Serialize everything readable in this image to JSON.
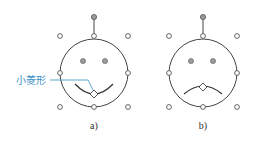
{
  "figures": [
    {
      "id": "a",
      "caption": "a)",
      "expression": "smile",
      "callout_label": "小菱形"
    },
    {
      "id": "b",
      "caption": "b)",
      "expression": "frown",
      "callout_label": ""
    }
  ],
  "colors": {
    "outline": "#444444",
    "handle_fill": "#ffffff",
    "rotation_handle_fill": "#999999",
    "eye_fill": "#999999",
    "callout": "#3a8fc6"
  }
}
